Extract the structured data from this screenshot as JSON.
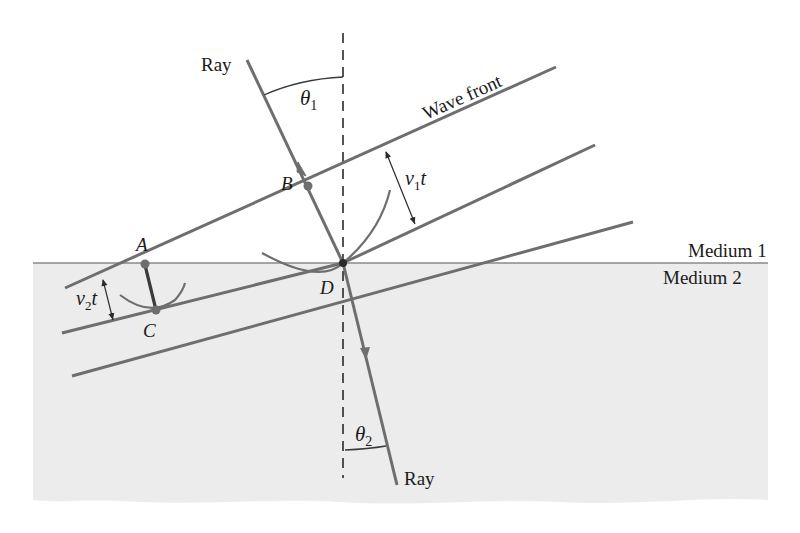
{
  "figure": {
    "type": "refraction-wavefront-diagram",
    "labels": {
      "ray_in": "Ray",
      "ray_out": "Ray",
      "wave_front": "Wave front",
      "medium_1": "Medium 1",
      "medium_2": "Medium 2",
      "point_a": "A",
      "point_b": "B",
      "point_c": "C",
      "point_d": "D",
      "theta1_sym": "θ",
      "theta1_sub": "1",
      "theta2_sym": "θ",
      "theta2_sub": "2",
      "v1t_v": "v",
      "v1t_sub": "1",
      "v1t_t": "t",
      "v2t_v": "v",
      "v2t_sub": "2",
      "v2t_t": "t"
    },
    "colors": {
      "line": "#6e6e6e",
      "dark_line": "#3a3a3a",
      "medium2_fill": "#ececec",
      "interface": "#8a8a8a",
      "text": "#1a1a1a"
    }
  }
}
